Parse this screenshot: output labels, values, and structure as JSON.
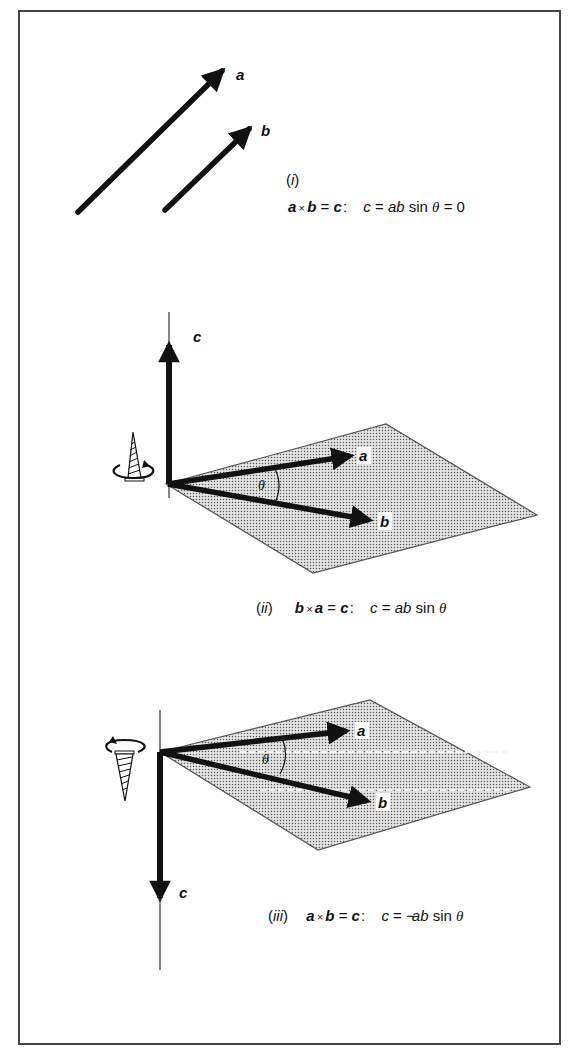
{
  "colors": {
    "ink": "#111111",
    "frame": "#444444",
    "plane_fill": "#c8c8c8",
    "plane_edge": "#555555",
    "background": "#ffffff"
  },
  "panels": [
    {
      "id": "i",
      "label": "(i)",
      "label_numeral": "i",
      "vectors": [
        {
          "name": "a",
          "label": "a",
          "from": [
            78,
            212
          ],
          "to": [
            229,
            64
          ]
        },
        {
          "name": "b",
          "label": "b",
          "from": [
            165,
            210
          ],
          "to": [
            256,
            122
          ]
        }
      ],
      "equation": {
        "lhs_v1": "a",
        "op": "×",
        "lhs_v2": "b",
        "eq": "=",
        "rhs": "c",
        "colon": ":",
        "magnitude_var": "c",
        "eq2": "=",
        "coeff": "ab",
        "func": "sin",
        "angle": "θ",
        "eq3": "=",
        "result": "0"
      }
    },
    {
      "id": "ii",
      "label": "(ii)",
      "label_numeral": "ii",
      "c_direction": "up",
      "c_label": "c",
      "angle_label": "θ",
      "plane": [
        [
          166,
          484
        ],
        [
          386,
          424
        ],
        [
          537,
          515
        ],
        [
          313,
          573
        ]
      ],
      "vectors": [
        {
          "name": "a",
          "label": "a",
          "to": [
            358,
            455
          ]
        },
        {
          "name": "b",
          "label": "b",
          "to": [
            377,
            522
          ]
        }
      ],
      "screw": "screw-pointing-up",
      "equation": {
        "lhs_v1": "b",
        "op": "×",
        "lhs_v2": "a",
        "eq": "=",
        "rhs": "c",
        "colon": ":",
        "magnitude_var": "c",
        "eq2": "=",
        "coeff": "ab",
        "func": "sin",
        "angle": "θ"
      }
    },
    {
      "id": "iii",
      "label": "(iii)",
      "label_numeral": "iii",
      "c_direction": "down",
      "c_label": "c",
      "angle_label": "θ",
      "plane": [
        [
          160,
          752
        ],
        [
          370,
          700
        ],
        [
          530,
          787
        ],
        [
          318,
          850
        ]
      ],
      "vectors": [
        {
          "name": "a",
          "label": "a",
          "to": [
            353,
            730
          ]
        },
        {
          "name": "b",
          "label": "b",
          "to": [
            375,
            803
          ]
        }
      ],
      "screw": "screw-pointing-down",
      "equation": {
        "lhs_v1": "a",
        "op": "×",
        "lhs_v2": "b",
        "eq": "=",
        "rhs": "c",
        "colon": ":",
        "magnitude_var": "c",
        "eq2": "=",
        "sign": "−",
        "coeff": "ab",
        "func": "sin",
        "angle": "θ"
      }
    }
  ]
}
